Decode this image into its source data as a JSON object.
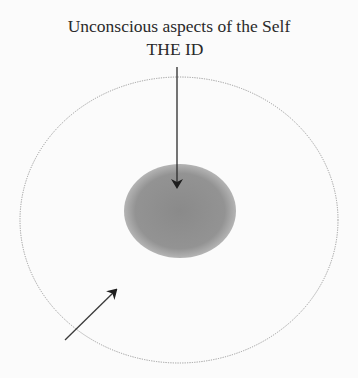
{
  "diagram": {
    "title_line1": "Unconscious aspects of the Self",
    "title_line2": "THE ID",
    "shapes": {
      "outer_ellipse": {
        "cx": 179,
        "cy": 220,
        "rx": 159,
        "ry": 143,
        "stroke": "#9a9a9a",
        "style": "dotted"
      },
      "inner_ellipse": {
        "cx": 180,
        "cy": 211,
        "rx": 56,
        "ry": 47,
        "fill": "#8e8e8e"
      },
      "arrow_down": {
        "x1": 177,
        "y1": 67,
        "x2": 177,
        "y2": 188
      },
      "arrow_diagonal": {
        "x1": 65,
        "y1": 340,
        "x2": 117,
        "y2": 289
      }
    }
  }
}
